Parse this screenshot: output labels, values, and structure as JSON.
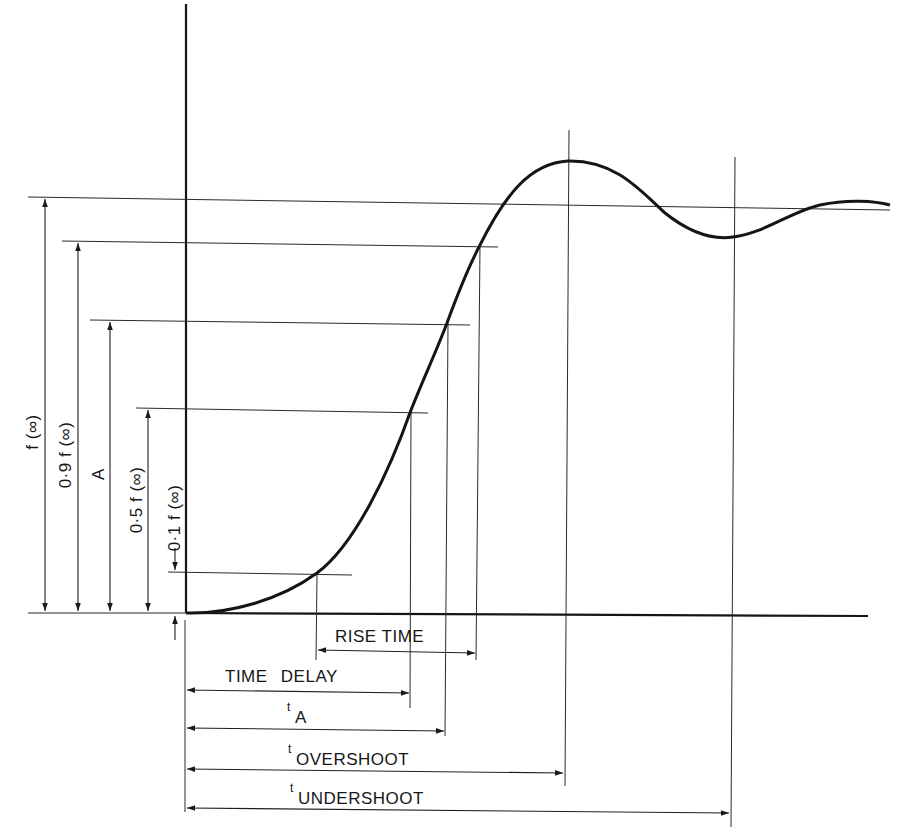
{
  "figure": {
    "type": "step-response-definitions",
    "vertical_labels": {
      "f_inf": "f (∞)",
      "f_09": "0·9 f (∞)",
      "A": "A",
      "f_05": "0·5 f (∞)",
      "f_01": "0·1 f (∞)"
    },
    "horizontal_labels": {
      "rise_time": "RISE TIME",
      "time_delay": "TIME DELAY",
      "t_A_t": "t",
      "t_A_sub": "A",
      "t_overshoot_t": "t",
      "t_overshoot_sub": "OVERSHOOT",
      "t_undershoot_t": "t",
      "t_undershoot_sub": "UNDERSHOOT"
    }
  },
  "colors": {
    "ink": "#161616",
    "background": "#ffffff"
  }
}
